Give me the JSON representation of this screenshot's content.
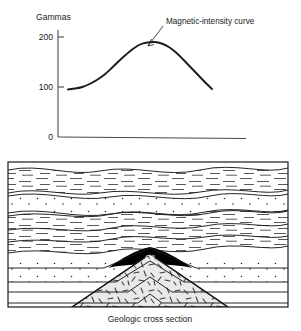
{
  "figure": {
    "caption": "Geologic cross section"
  },
  "chart_data": {
    "type": "line",
    "title": "",
    "ylabel": "Gammas",
    "xlabel": "",
    "ylim": [
      0,
      230
    ],
    "yticks": [
      0,
      100,
      200
    ],
    "ytick_labels": [
      "0",
      "100",
      "200"
    ],
    "grid": false,
    "legend": "none",
    "series": [
      {
        "name": "Magnetic-intensity curve",
        "x": [
          0,
          5,
          10,
          15,
          20,
          25,
          30,
          35,
          40,
          45,
          50,
          55,
          60,
          65,
          70,
          75,
          80,
          85,
          90,
          95,
          100
        ],
        "values": [
          95,
          97,
          100,
          106,
          114,
          124,
          137,
          151,
          164,
          176,
          185,
          189,
          190,
          187,
          180,
          169,
          155,
          140,
          125,
          110,
          96
        ]
      }
    ],
    "annotations": [
      {
        "text": "Magnetic-intensity curve",
        "points_to": "curve-peak",
        "peak_value": 190
      }
    ]
  },
  "cross_section": {
    "oil_label": "Oil",
    "layers": [
      {
        "name": "shale-upper",
        "pattern": "dashes"
      },
      {
        "name": "sandstone-upper",
        "pattern": "dots"
      },
      {
        "name": "shale-middle",
        "pattern": "dashes"
      },
      {
        "name": "oil-trap",
        "pattern": "solid-black"
      },
      {
        "name": "sandstone-lower",
        "pattern": "dots"
      },
      {
        "name": "limestone-lower",
        "pattern": "plain"
      },
      {
        "name": "igneous-intrusion",
        "pattern": "random-dashes"
      }
    ],
    "colors": {
      "line": "#1a1a1a",
      "oil": "#000000",
      "intrusion_fill": "#e8e8e8",
      "background": "#ffffff"
    }
  }
}
